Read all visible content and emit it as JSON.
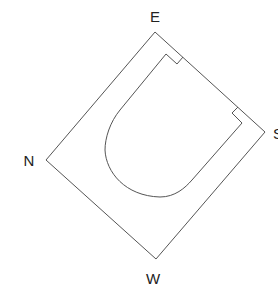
{
  "diagram": {
    "type": "compass-oriented floor plan",
    "labels": {
      "east": "E",
      "south": "S",
      "west": "W",
      "north": "N"
    },
    "shapes": {
      "outer": "rotated rectangle",
      "inner": "U-shaped rounded outline with two notches"
    },
    "colors": {
      "stroke": "#555555",
      "text": "#222222",
      "background": "#ffffff"
    }
  }
}
